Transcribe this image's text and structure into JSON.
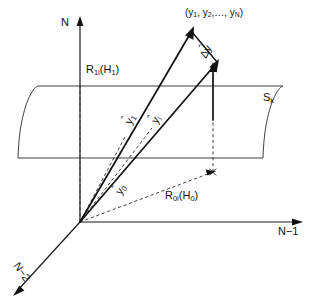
{
  "figure": {
    "kind": "geometric-vector-diagram",
    "background_color": "#ffffff",
    "line_color": "#1a1a1a",
    "width": 324,
    "height": 302
  },
  "axes": {
    "vertical": {
      "label": "N",
      "name": "axis-n"
    },
    "horizontal": {
      "label": "N−1",
      "name": "axis-n-minus-1"
    },
    "depth": {
      "label": "N−2",
      "name": "axis-n-minus-2"
    }
  },
  "regions": {
    "upper": {
      "label_main": "R",
      "label_sub": "1i",
      "label_paren_open": "(H",
      "label_paren_sub": "1",
      "label_paren_close": ")",
      "full": "R1i(H1)"
    },
    "lower": {
      "label_main": "R",
      "label_sub": "0i",
      "label_paren_open": "(H",
      "label_paren_sub": "0",
      "label_paren_close": ")",
      "full": "R0i(H0)"
    }
  },
  "surface": {
    "label_main": "S",
    "label_sub": "k",
    "full": "Sk"
  },
  "point": {
    "label": "(y₁, y₂,…, yₙ)",
    "parts": {
      "open": "(y",
      "s1": "1",
      "comma1": ", y",
      "s2": "2",
      "comma2": ",…, y",
      "s3": "N",
      "close": ")"
    }
  },
  "vectors": [
    {
      "name": "vector-y-hat-1",
      "symbol": "y",
      "accent": "ˆ",
      "subscript": "1"
    },
    {
      "name": "vector-y-hat-i",
      "symbol": "y",
      "accent": "ˆ",
      "subscript": "i"
    },
    {
      "name": "vector-y-hat-0",
      "symbol": "y",
      "accent": "ˆ",
      "subscript": "0"
    },
    {
      "name": "vector-delta-y-hat",
      "symbol": "Δy",
      "accent": "ˆ",
      "subscript": ""
    }
  ]
}
